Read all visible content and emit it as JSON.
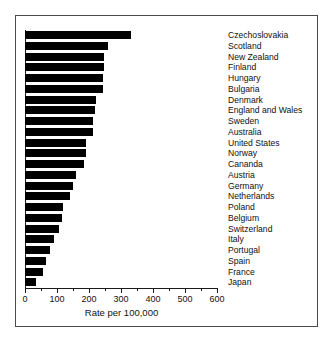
{
  "chart_data": {
    "type": "bar",
    "orientation": "horizontal",
    "title": "",
    "xlabel": "Rate per 100,000",
    "ylabel": "",
    "xlim": [
      0,
      620
    ],
    "xticks": [
      0,
      100,
      200,
      300,
      400,
      500,
      600
    ],
    "xtick_labels": [
      "0",
      "100",
      "200",
      "300",
      "400",
      "500",
      "600"
    ],
    "minor_ticks": [
      50,
      150,
      250,
      350,
      450,
      550
    ],
    "grid": false,
    "legend": null,
    "bar_color": "#000000",
    "categories": [
      "Czechoslovakia",
      "Scotland",
      "New Zealand",
      "Finland",
      "Hungary",
      "Bulgaria",
      "Denmark",
      "England and Wales",
      "Sweden",
      "Australia",
      "United States",
      "Norway",
      "Cananda",
      "Austria",
      "Germany",
      "Netherlands",
      "Poland",
      "Belgium",
      "Switzerland",
      "Italy",
      "Portugal",
      "Spain",
      "France",
      "Japan"
    ],
    "values": [
      331,
      260,
      247,
      247,
      243,
      243,
      222,
      219,
      213,
      213,
      191,
      191,
      185,
      159,
      150,
      141,
      119,
      116,
      106,
      91,
      78,
      66,
      56,
      34
    ]
  }
}
